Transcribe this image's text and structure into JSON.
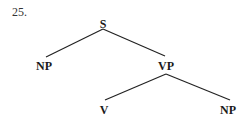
{
  "item_number": "25.",
  "tree": {
    "nodes": [
      {
        "id": "S",
        "label": "S",
        "x": 103,
        "y": 18
      },
      {
        "id": "NP1",
        "label": "NP",
        "x": 44,
        "y": 60
      },
      {
        "id": "VP",
        "label": "VP",
        "x": 166,
        "y": 60
      },
      {
        "id": "V",
        "label": "V",
        "x": 104,
        "y": 104
      },
      {
        "id": "NP2",
        "label": "NP",
        "x": 228,
        "y": 104
      }
    ],
    "edges": [
      {
        "from": "S",
        "to": "NP1"
      },
      {
        "from": "S",
        "to": "VP"
      },
      {
        "from": "VP",
        "to": "V"
      },
      {
        "from": "VP",
        "to": "NP2"
      }
    ]
  },
  "style": {
    "line_color": "#222222",
    "text_color": "#1a1a1a"
  }
}
